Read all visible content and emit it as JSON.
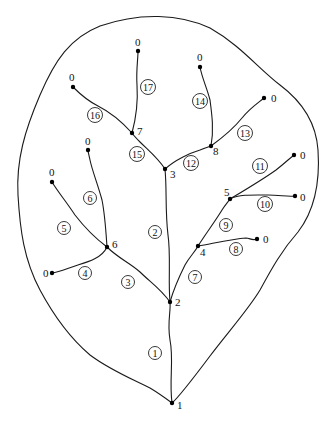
{
  "diagram": {
    "type": "stream-network-tree-in-watershed",
    "colors": {
      "line": "#1a1a1a",
      "background": "#ffffff"
    },
    "nodes": [
      {
        "id": "n1",
        "label": "1",
        "x": 172,
        "y": 403,
        "lx": 177,
        "ly": 409
      },
      {
        "id": "n2",
        "label": "2",
        "x": 170,
        "y": 302,
        "lx": 175,
        "ly": 306
      },
      {
        "id": "n3",
        "label": "3",
        "x": 165,
        "y": 169,
        "lx": 170,
        "ly": 178
      },
      {
        "id": "n4",
        "label": "4",
        "x": 198,
        "y": 246,
        "lx": 200,
        "ly": 256
      },
      {
        "id": "n5",
        "label": "5",
        "x": 230,
        "y": 199,
        "lx": 224,
        "ly": 196
      },
      {
        "id": "n6",
        "label": "6",
        "x": 107,
        "y": 247,
        "lx": 112,
        "ly": 248
      },
      {
        "id": "n7",
        "label": "7",
        "x": 132,
        "y": 133,
        "lx": 137,
        "ly": 135
      },
      {
        "id": "n8",
        "label": "8",
        "x": 211,
        "y": 146,
        "lx": 213,
        "ly": 155
      },
      {
        "id": "s17",
        "label": "0",
        "x": 138,
        "y": 51,
        "lx": 135,
        "ly": 46
      },
      {
        "id": "s16",
        "label": "0",
        "x": 73,
        "y": 87,
        "lx": 69,
        "ly": 81
      },
      {
        "id": "s14",
        "label": "0",
        "x": 200,
        "y": 67,
        "lx": 197,
        "ly": 61
      },
      {
        "id": "s13",
        "label": "0",
        "x": 264,
        "y": 98,
        "lx": 271,
        "ly": 102
      },
      {
        "id": "s11",
        "label": "0",
        "x": 294,
        "y": 155,
        "lx": 300,
        "ly": 159
      },
      {
        "id": "s10",
        "label": "0",
        "x": 295,
        "y": 196,
        "lx": 300,
        "ly": 201
      },
      {
        "id": "s8",
        "label": "0",
        "x": 257,
        "y": 239,
        "lx": 263,
        "ly": 243
      },
      {
        "id": "s6",
        "label": "0",
        "x": 88,
        "y": 150,
        "lx": 85,
        "ly": 145
      },
      {
        "id": "s5",
        "label": "0",
        "x": 52,
        "y": 182,
        "lx": 49,
        "ly": 176
      },
      {
        "id": "s4",
        "label": "0",
        "x": 52,
        "y": 273,
        "lx": 43,
        "ly": 277
      }
    ],
    "edges": [
      {
        "id": "1",
        "label": "1",
        "path": "M172,403 C169,380 174,360 170,340 C167,322 171,312 170,302",
        "cx": 155,
        "cy": 353
      },
      {
        "id": "2",
        "label": "2",
        "path": "M170,302 C168,280 171,255 168,235 C165,210 167,190 165,169",
        "cx": 155,
        "cy": 232
      },
      {
        "id": "3",
        "label": "3",
        "path": "M170,302 C160,288 150,282 140,272 C130,263 118,258 107,247",
        "cx": 128,
        "cy": 282
      },
      {
        "id": "4",
        "label": "4",
        "path": "M107,247 C102,258 88,262 78,265 C68,268 60,272 52,273",
        "cx": 85,
        "cy": 273
      },
      {
        "id": "5",
        "label": "5",
        "path": "M107,247 C95,238 85,228 75,215 C65,200 58,192 52,182",
        "cx": 64,
        "cy": 228
      },
      {
        "id": "6",
        "label": "6",
        "path": "M107,247 C106,232 105,215 102,200 C98,185 92,170 90,160 C89,155 88,152 88,150",
        "cx": 90,
        "cy": 198
      },
      {
        "id": "7",
        "label": "7",
        "path": "M170,302 C174,288 180,275 185,265 C190,256 195,252 198,246",
        "cx": 195,
        "cy": 277
      },
      {
        "id": "8",
        "label": "8",
        "path": "M198,246 C215,243 232,239 246,238 C250,238 252,241 257,239",
        "cx": 236,
        "cy": 249
      },
      {
        "id": "9",
        "label": "9",
        "path": "M198,246 C207,232 216,220 222,210 C225,205 228,202 230,199",
        "cx": 226,
        "cy": 225
      },
      {
        "id": "10",
        "label": "10",
        "path": "M230,199 C240,194 255,195 268,195 C280,195 288,197 295,196",
        "cx": 265,
        "cy": 204
      },
      {
        "id": "11",
        "label": "11",
        "path": "M230,199 C245,190 262,180 276,170 C285,163 290,158 294,155",
        "cx": 260,
        "cy": 166
      },
      {
        "id": "12",
        "label": "12",
        "path": "M165,169 C175,160 190,153 200,150 C205,148 208,147 211,146",
        "cx": 191,
        "cy": 163
      },
      {
        "id": "13",
        "label": "13",
        "path": "M211,146 C222,138 234,128 242,118 C250,108 258,103 264,98",
        "cx": 245,
        "cy": 133
      },
      {
        "id": "14",
        "label": "14",
        "path": "M211,146 C214,130 212,115 210,100 C207,88 202,78 200,67",
        "cx": 200,
        "cy": 101
      },
      {
        "id": "15",
        "label": "15",
        "path": "M165,169 C158,158 148,150 140,142 C136,138 134,136 132,133",
        "cx": 137,
        "cy": 154
      },
      {
        "id": "16",
        "label": "16",
        "path": "M132,133 C122,122 110,112 98,106 C86,100 78,92 73,87",
        "cx": 95,
        "cy": 115
      },
      {
        "id": "17",
        "label": "17",
        "path": "M132,133 C136,118 138,100 137,85 C136,70 138,60 138,51",
        "cx": 148,
        "cy": 87
      }
    ],
    "boundary_path": "M172,403 C180,396 195,376 210,356 C228,332 248,310 260,290 C272,268 282,250 298,232 C315,210 320,180 318,150 C316,120 300,100 280,85 C258,68 240,45 210,28 C180,14 140,12 100,26 C70,38 55,60 40,95 C25,130 16,160 18,195 C20,230 24,260 40,290 C55,318 70,338 90,355 C110,370 130,378 150,388 C160,394 168,400 172,403 Z"
  }
}
